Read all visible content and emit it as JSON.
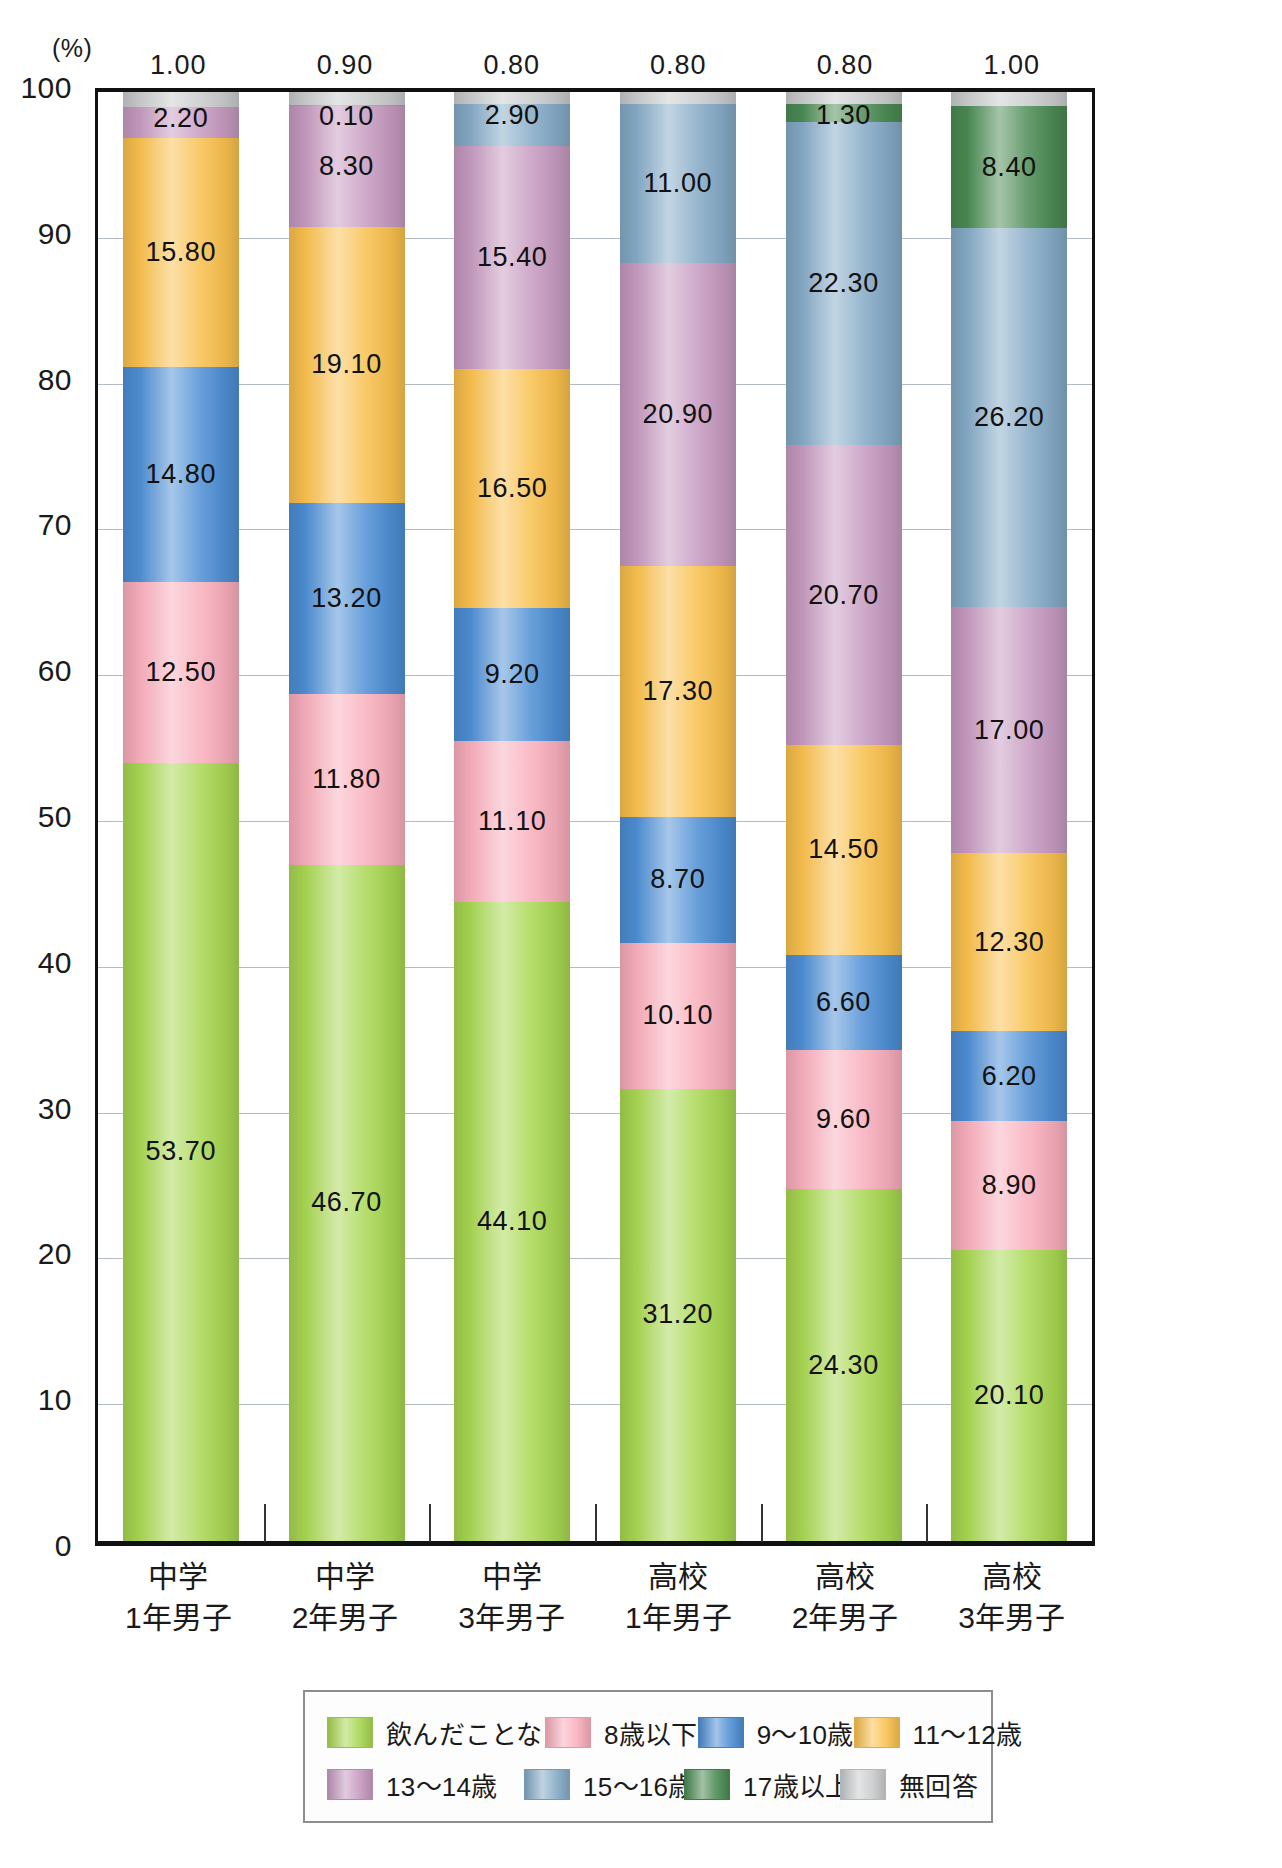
{
  "chart_data": {
    "type": "bar",
    "subtype": "stacked-percent",
    "title": "",
    "xlabel": "",
    "ylabel": "(%)",
    "unit_label": "(%)",
    "ylim": [
      0,
      100
    ],
    "ytick_step": 10,
    "yticks": [
      "100",
      "90",
      "80",
      "70",
      "60",
      "50",
      "40",
      "30",
      "20",
      "10",
      "0"
    ],
    "grid": true,
    "legend_position": "bottom",
    "categories": [
      "中学\n1年男子",
      "中学\n2年男子",
      "中学\n3年男子",
      "高校\n1年男子",
      "高校\n2年男子",
      "高校\n3年男子"
    ],
    "category_lines": [
      [
        "中学",
        "1年男子"
      ],
      [
        "中学",
        "2年男子"
      ],
      [
        "中学",
        "3年男子"
      ],
      [
        "高校",
        "1年男子"
      ],
      [
        "高校",
        "2年男子"
      ],
      [
        "高校",
        "3年男子"
      ]
    ],
    "top_values": [
      "1.00",
      "0.90",
      "0.80",
      "0.80",
      "0.80",
      "1.00"
    ],
    "series": [
      {
        "name": "飲んだことない",
        "color": "#a8d751",
        "values": [
          53.7,
          46.7,
          44.1,
          31.2,
          24.3,
          20.1
        ],
        "labels": [
          "53.70",
          "46.70",
          "44.10",
          "31.20",
          "24.30",
          "20.10"
        ]
      },
      {
        "name": "8歳以下",
        "color": "#f9aebc",
        "values": [
          12.5,
          11.8,
          11.1,
          10.1,
          9.6,
          8.9
        ],
        "labels": [
          "12.50",
          "11.80",
          "11.10",
          "10.10",
          "9.60",
          "8.90"
        ]
      },
      {
        "name": "9〜10歳",
        "color": "#4d8ed4",
        "values": [
          14.8,
          13.2,
          9.2,
          8.7,
          6.6,
          6.2
        ],
        "labels": [
          "14.80",
          "13.20",
          "9.20",
          "8.70",
          "6.60",
          "6.20"
        ]
      },
      {
        "name": "11〜12歳",
        "color": "#f9c04d",
        "values": [
          15.8,
          19.1,
          16.5,
          17.3,
          14.5,
          12.3
        ],
        "labels": [
          "15.80",
          "19.10",
          "16.50",
          "17.30",
          "14.50",
          "12.30"
        ]
      },
      {
        "name": "13〜14歳",
        "color": "#c69ac0",
        "values": [
          2.2,
          8.3,
          15.4,
          20.9,
          20.7,
          17.0
        ],
        "labels": [
          "2.20",
          "8.30",
          "15.40",
          "20.90",
          "20.70",
          "17.00"
        ]
      },
      {
        "name": "15〜16歳",
        "color": "#85aac6",
        "values": [
          0.0,
          0.1,
          2.9,
          11.0,
          22.3,
          26.2
        ],
        "labels": [
          "",
          "0.10",
          "2.90",
          "11.00",
          "22.30",
          "26.20"
        ]
      },
      {
        "name": "17歳以上",
        "color": "#4a8a53",
        "values": [
          0.0,
          0.0,
          0.0,
          0.0,
          1.3,
          8.4
        ],
        "labels": [
          "",
          "",
          "",
          "",
          "1.30",
          "8.40"
        ]
      },
      {
        "name": "無回答",
        "color": "#c9cbcc",
        "values": [
          1.0,
          0.9,
          0.8,
          0.8,
          0.8,
          1.0
        ],
        "labels": [
          "",
          "",
          "",
          "",
          "",
          ""
        ]
      }
    ]
  },
  "legend": {
    "rows": [
      [
        {
          "label": "飲んだことない",
          "color": "#a8d751",
          "swatch_name": "legend-swatch-never-drank"
        },
        {
          "label": "8歳以下",
          "color": "#f9aebc",
          "swatch_name": "legend-swatch-under-8"
        },
        {
          "label": "9〜10歳",
          "color": "#4d8ed4",
          "swatch_name": "legend-swatch-9-10"
        },
        {
          "label": "11〜12歳",
          "color": "#f9c04d",
          "swatch_name": "legend-swatch-11-12"
        }
      ],
      [
        {
          "label": "13〜14歳",
          "color": "#c69ac0",
          "swatch_name": "legend-swatch-13-14"
        },
        {
          "label": "15〜16歳",
          "color": "#85aac6",
          "swatch_name": "legend-swatch-15-16"
        },
        {
          "label": "17歳以上",
          "color": "#4a8a53",
          "swatch_name": "legend-swatch-17-plus"
        },
        {
          "label": "無回答",
          "color": "#c9cbcc",
          "swatch_name": "legend-swatch-no-answer"
        }
      ]
    ]
  }
}
